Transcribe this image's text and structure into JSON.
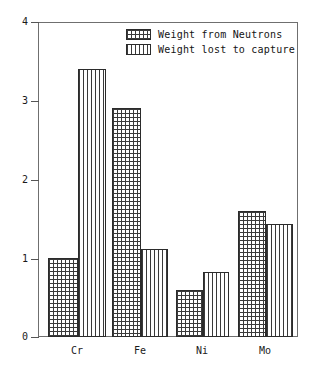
{
  "chart_data": {
    "type": "bar",
    "title": "",
    "xlabel": "",
    "ylabel": "",
    "categories": [
      "Cr",
      "Fe",
      "Ni",
      "Mo"
    ],
    "series": [
      {
        "name": "Weight from Neutrons",
        "fill": "crosshatch",
        "values": [
          1.0,
          2.91,
          0.6,
          1.6
        ]
      },
      {
        "name": "Weight lost to capture",
        "fill": "vertical-lines",
        "values": [
          3.4,
          1.12,
          0.83,
          1.43
        ]
      }
    ],
    "ylim": [
      0,
      4
    ],
    "yticks": [
      0,
      1,
      2,
      3,
      4
    ],
    "ytick_labels": [
      "0",
      "1",
      "2",
      "3",
      "4"
    ],
    "grid": false,
    "legend_position": "top-center",
    "frame_color": "#6f6f6f",
    "bar_edge_color": "#2b2b2b",
    "hatch_color": "#3a3a3a",
    "background": "#ffffff"
  },
  "axis": {
    "y_labels": [
      "4",
      "3",
      "2",
      "1",
      "0"
    ],
    "x_labels": [
      "Cr",
      "Fe",
      "Ni",
      "Mo"
    ]
  },
  "legend": {
    "entries": [
      {
        "label": "Weight from Neutrons"
      },
      {
        "label": "Weight lost to capture"
      }
    ]
  }
}
